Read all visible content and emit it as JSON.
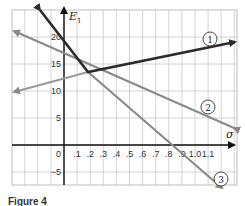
{
  "chart_data": {
    "type": "line",
    "title": "",
    "xlabel": "σ",
    "ylabel": "E₁",
    "xlim": [
      -0.35,
      1.25
    ],
    "ylim": [
      -7.5,
      25
    ],
    "x_ticks": [
      ".1",
      ".2",
      ".3",
      ".4",
      ".5",
      ".6",
      ".7",
      ".8",
      ".9",
      "1.0",
      "1.1"
    ],
    "y_ticks": [
      "20",
      "15",
      "10",
      "5",
      "0",
      "−5"
    ],
    "grid": true,
    "series": [
      {
        "name": "1",
        "label": "①",
        "color": "#2b2b2b",
        "points": [
          [
            -0.17,
            24.5
          ],
          [
            0.3,
            13.5
          ],
          [
            1.25,
            19.0
          ]
        ],
        "note": "upper envelope, piecewise linear, arrows at both ends"
      },
      {
        "name": "2",
        "label": "②",
        "color": "#8a8a8a",
        "points": [
          [
            -0.35,
            21.0
          ],
          [
            1.25,
            2.5
          ]
        ]
      },
      {
        "name": "3",
        "label": "③",
        "color": "#8a8a8a",
        "points": [
          [
            0.3,
            13.5
          ],
          [
            1.22,
            -8.0
          ]
        ]
      },
      {
        "name": "1-lower",
        "label": "",
        "color": "#9a9a9a",
        "points": [
          [
            -0.35,
            10.0
          ],
          [
            0.3,
            13.5
          ]
        ]
      }
    ],
    "annotations": [
      "①",
      "②",
      "③"
    ]
  },
  "labels": {
    "y_axis": "E",
    "y_axis_sub": "1",
    "x_axis": "σ",
    "circle_1": "1",
    "circle_2": "2",
    "circle_3": "3",
    "caption": "Figure 4"
  }
}
